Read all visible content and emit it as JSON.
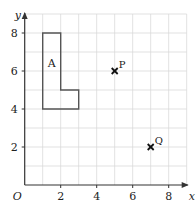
{
  "diagram": {
    "type": "coordinate-grid",
    "x_axis": {
      "label": "x",
      "range": [
        0,
        9
      ],
      "ticks": [
        2,
        4,
        6,
        8
      ],
      "tick_labels": [
        "2",
        "4",
        "6",
        "8"
      ]
    },
    "y_axis": {
      "label": "y",
      "range": [
        0,
        9
      ],
      "ticks": [
        2,
        4,
        6,
        8
      ],
      "tick_labels": [
        "2",
        "4",
        "6",
        "8"
      ]
    },
    "origin_label": "O",
    "grid": true,
    "shapes": [
      {
        "name": "A",
        "label": "A",
        "label_position": [
          1.5,
          6.4
        ],
        "vertices": [
          [
            1,
            4
          ],
          [
            1,
            8
          ],
          [
            2,
            8
          ],
          [
            2,
            5
          ],
          [
            3,
            5
          ],
          [
            3,
            4
          ]
        ]
      }
    ],
    "points": [
      {
        "name": "P",
        "label": "P",
        "x": 5,
        "y": 6
      },
      {
        "name": "Q",
        "label": "Q",
        "x": 7,
        "y": 2
      }
    ]
  }
}
